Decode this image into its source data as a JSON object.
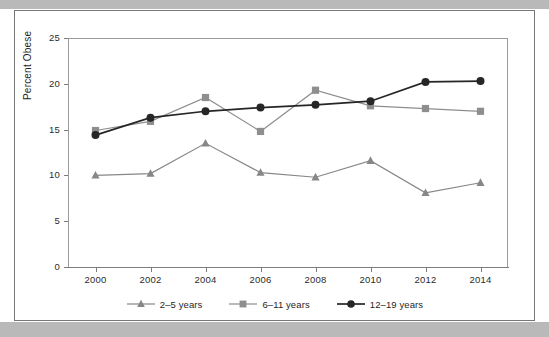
{
  "figure": {
    "background_color": "#ffffff",
    "band_color": "#b9b9b9",
    "frame_color": "#777777"
  },
  "axis": {
    "y_title": "Percent Obese",
    "y_ticks": [
      "0",
      "5",
      "10",
      "15",
      "20",
      "25"
    ],
    "x_ticks": [
      "2000",
      "2002",
      "2004",
      "2006",
      "2008",
      "2010",
      "2012",
      "2014"
    ]
  },
  "legend": {
    "items": [
      {
        "label": "2–5 years",
        "marker": "triangle-marker",
        "color": "#878787"
      },
      {
        "label": "6–11 years",
        "marker": "square-marker",
        "color": "#8e8e8e"
      },
      {
        "label": "12–19 years",
        "marker": "circle-marker",
        "color": "#262626"
      }
    ]
  },
  "chart_data": {
    "type": "line",
    "title": "",
    "xlabel": "",
    "ylabel": "Percent Obese",
    "x": [
      2000,
      2002,
      2004,
      2006,
      2008,
      2010,
      2012,
      2014
    ],
    "xlim": [
      1999,
      2015
    ],
    "ylim": [
      0,
      25
    ],
    "y_ticks": [
      0,
      5,
      10,
      15,
      20,
      25
    ],
    "x_ticks": [
      2000,
      2002,
      2004,
      2006,
      2008,
      2010,
      2012,
      2014
    ],
    "grid": false,
    "legend_position": "bottom-center",
    "series": [
      {
        "name": "2–5 years",
        "marker": "triangle",
        "color": "#878787",
        "values": [
          10.0,
          10.2,
          13.5,
          10.3,
          9.8,
          11.6,
          8.1,
          9.2
        ]
      },
      {
        "name": "6–11 years",
        "marker": "square",
        "color": "#8e8e8e",
        "values": [
          14.9,
          15.9,
          18.5,
          14.8,
          19.3,
          17.6,
          17.3,
          17.0
        ]
      },
      {
        "name": "12–19 years",
        "marker": "circle",
        "color": "#262626",
        "values": [
          14.4,
          16.3,
          17.0,
          17.4,
          17.7,
          18.1,
          20.2,
          20.3
        ]
      }
    ]
  }
}
